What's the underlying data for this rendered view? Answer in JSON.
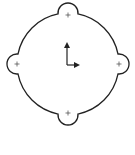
{
  "diagram": {
    "stroke_color": "#222222",
    "background": "#ffffff",
    "main_circle": {
      "cx": 68,
      "cy": 64,
      "r": 51
    },
    "lobes": [
      {
        "name": "top",
        "cx": 68,
        "cy": 15,
        "r": 10
      },
      {
        "name": "right",
        "cx": 119,
        "cy": 64,
        "r": 10
      },
      {
        "name": "bottom",
        "cx": 68,
        "cy": 113,
        "r": 10
      },
      {
        "name": "left",
        "cx": 17,
        "cy": 64,
        "r": 10
      }
    ],
    "axes": {
      "origin_x": 67,
      "origin_y": 65,
      "y_end": 42,
      "x_end": 80
    }
  }
}
